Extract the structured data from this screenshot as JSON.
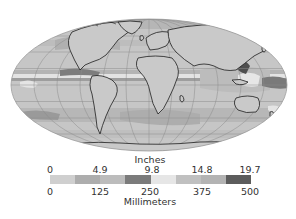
{
  "map": {
    "projection": "mollweide",
    "description": "Global precipitation map (grayscale)",
    "background_color": "#ffffff",
    "ocean_base_color": "#c6c6c6",
    "coastline_color": "#1e1e1e",
    "graticule_color": "#8c8c8c"
  },
  "legend": {
    "top_title": "Inches",
    "bottom_title": "Millimeters",
    "inch_ticks": [
      "0",
      "4.9",
      "9.8",
      "14.8",
      "19.7"
    ],
    "mm_ticks": [
      "0",
      "125",
      "250",
      "375",
      "500"
    ],
    "colorbar_colors": [
      "#cfcfcf",
      "#adadad",
      "#bcbcbc",
      "#7b7b7b",
      "#e6e6e6",
      "#c0c0c0",
      "#b3b3b3",
      "#5c5c5c"
    ]
  }
}
